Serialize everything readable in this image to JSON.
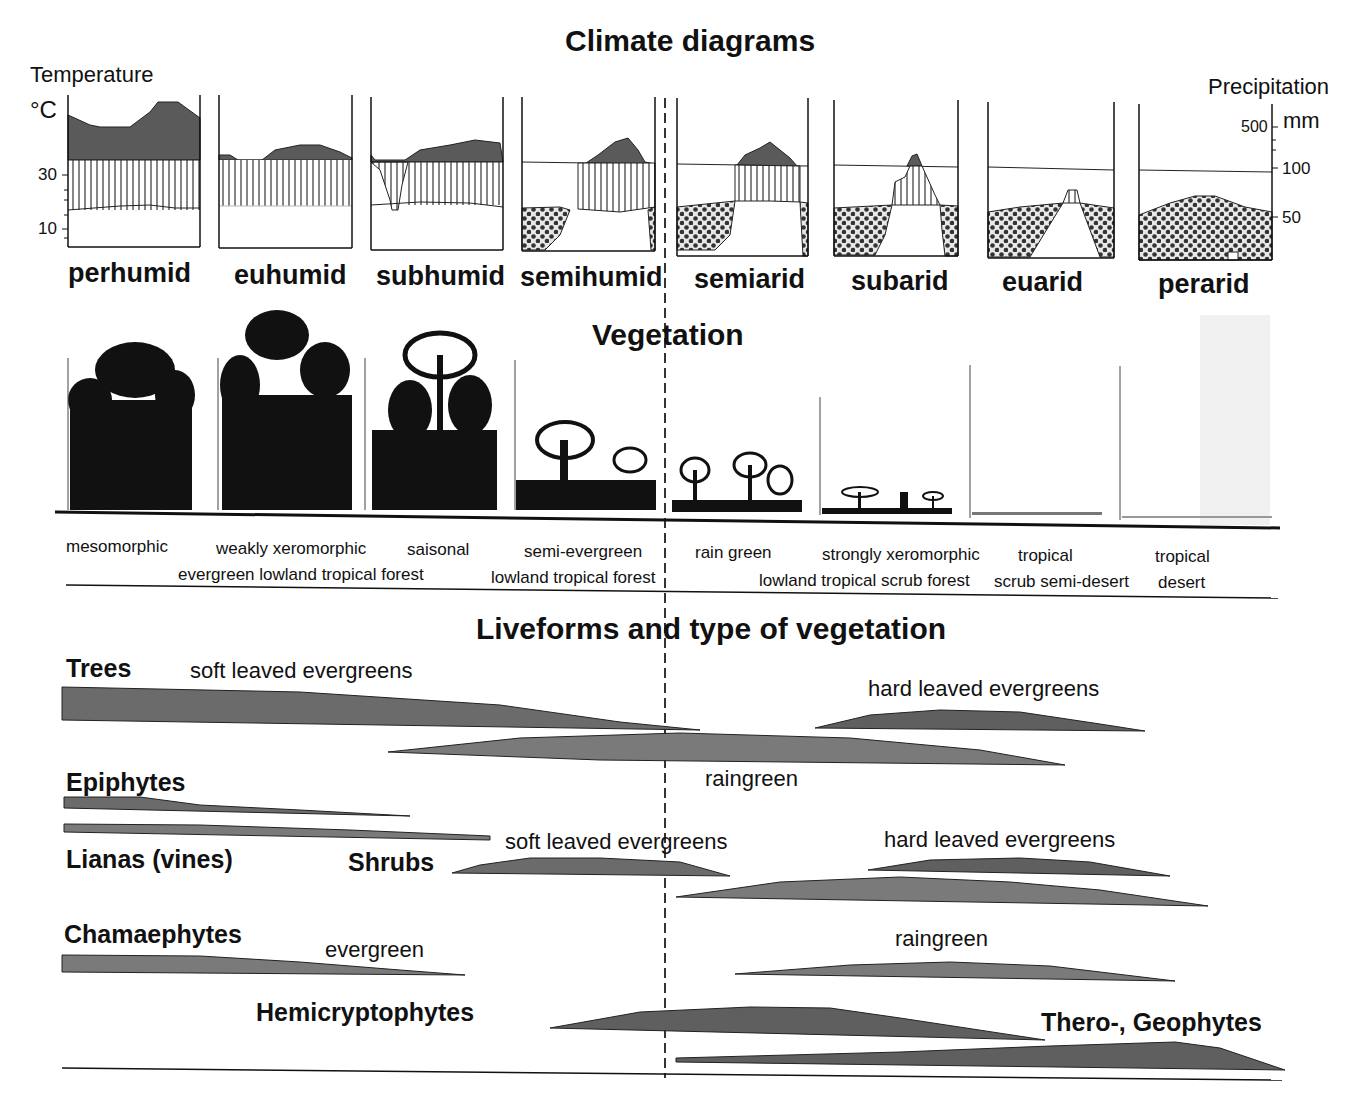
{
  "titles": {
    "climate": "Climate diagrams",
    "vegetation": "Vegetation",
    "liveforms": "Liveforms and type of vegetation"
  },
  "axes": {
    "temperature_label": "Temperature",
    "temperature_unit": "°C",
    "temperature_ticks": [
      "30",
      "10"
    ],
    "precipitation_label": "Precipitation",
    "precipitation_unit": "mm",
    "precipitation_ticks": [
      "500",
      "100",
      "50"
    ]
  },
  "climate_types": [
    "perhumid",
    "euhumid",
    "subhumid",
    "semihumid",
    "semiarid",
    "subarid",
    "euarid",
    "perarid"
  ],
  "vegetation_types": [
    {
      "line1": "mesomorphic",
      "line2": ""
    },
    {
      "line1": "weakly xeromorphic",
      "line2": "evergreen lowland tropical forest"
    },
    {
      "line1": "saisonal",
      "line2": ""
    },
    {
      "line1": "semi-evergreen",
      "line2": "lowland tropical forest"
    },
    {
      "line1": "rain green",
      "line2": ""
    },
    {
      "line1": "strongly xeromorphic",
      "line2": "lowland tropical scrub forest"
    },
    {
      "line1": "tropical",
      "line2": "scrub semi-desert"
    },
    {
      "line1": "tropical",
      "line2": "desert"
    }
  ],
  "liveforms": {
    "trees": "Trees",
    "trees_soft": "soft leaved evergreens",
    "trees_hard": "hard leaved evergreens",
    "trees_raingreen": "raingreen",
    "epiphytes": "Epiphytes",
    "lianas": "Lianas (vines)",
    "shrubs": "Shrubs",
    "shrubs_soft": "soft leaved evergreens",
    "shrubs_hard": "hard leaved evergreens",
    "chamaephytes": "Chamaephytes",
    "chamaephytes_evergreen": "evergreen",
    "chamaephytes_raingreen": "raingreen",
    "hemicryptophytes": "Hemicryptophytes",
    "thero_geophytes": "Thero-, Geophytes"
  },
  "colors": {
    "dark_fill": "#5a5a5a",
    "mid_fill": "#7a7a7a",
    "line": "#111111"
  }
}
